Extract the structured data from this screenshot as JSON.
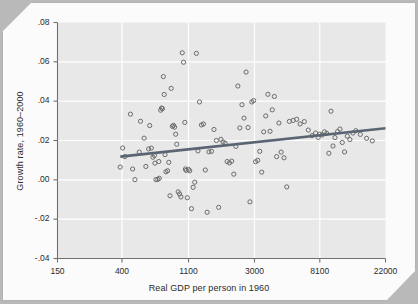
{
  "figure": {
    "background_color": "#e8e8e8",
    "grid_color": "#ffffff",
    "marker_color": "#6b6b6b",
    "line_color": "#5a6472",
    "axis_color": "#707070",
    "text_color": "#2b2b2b"
  },
  "chart_data": {
    "type": "scatter",
    "title": "",
    "xlabel": "Real GDP per person in 1960",
    "ylabel": "Growth rate, 1960–2000",
    "x_scale": "log",
    "y_scale": "linear",
    "xlim": [
      150,
      22000
    ],
    "ylim": [
      -0.04,
      0.08
    ],
    "xticks": [
      150,
      400,
      1100,
      3000,
      8100,
      22000
    ],
    "xticklabels": [
      "150",
      "400",
      "1100",
      "3000",
      "8100",
      "22000"
    ],
    "yticks": [
      -0.04,
      -0.02,
      0.0,
      0.02,
      0.04,
      0.06,
      0.08
    ],
    "yticklabels": [
      "-.04",
      "-.02",
      ".00",
      ".02",
      ".04",
      ".06",
      ".08"
    ],
    "grid": true,
    "grid_axis": "both",
    "legend": false,
    "series": [
      {
        "name": "Countries",
        "marker": "open-circle",
        "x": [
          389,
          404,
          418,
          455,
          470,
          487,
          520,
          530,
          560,
          575,
          600,
          610,
          625,
          640,
          655,
          660,
          670,
          690,
          700,
          705,
          720,
          730,
          740,
          750,
          760,
          770,
          780,
          800,
          815,
          830,
          845,
          860,
          875,
          890,
          905,
          920,
          940,
          960,
          980,
          1000,
          1020,
          1040,
          1050,
          1060,
          1080,
          1100,
          1120,
          1150,
          1180,
          1210,
          1240,
          1270,
          1300,
          1340,
          1380,
          1420,
          1460,
          1500,
          1560,
          1620,
          1680,
          1740,
          1800,
          1860,
          1920,
          1980,
          2050,
          2120,
          2190,
          2260,
          2330,
          2400,
          2480,
          2560,
          2640,
          2720,
          2800,
          2880,
          2960,
          3050,
          3150,
          3250,
          3350,
          3450,
          3560,
          3680,
          3800,
          3930,
          4060,
          4200,
          4350,
          4500,
          4700,
          4900,
          5100,
          5400,
          5700,
          6000,
          6400,
          6800,
          7200,
          7600,
          7900,
          8100,
          8400,
          8700,
          9000,
          9300,
          9600,
          9900,
          10200,
          10600,
          11000,
          11400,
          11800,
          12300,
          12800,
          13400,
          14000,
          15000,
          16500,
          18000
        ],
        "y": [
          0.0065,
          0.0162,
          0.0118,
          0.0334,
          0.0055,
          0.0001,
          0.0141,
          0.0298,
          0.0212,
          0.0068,
          0.0157,
          0.0276,
          0.0161,
          0.0115,
          0.0124,
          0.0085,
          0.0001,
          0.0002,
          0.0093,
          0.0008,
          0.0354,
          0.0365,
          0.0362,
          0.0525,
          0.0434,
          0.0128,
          0.0041,
          0.0046,
          0.0089,
          -0.0081,
          0.0465,
          0.0272,
          0.0277,
          0.0268,
          0.0232,
          0.0181,
          -0.0061,
          -0.0072,
          -0.0087,
          0.0646,
          0.0598,
          0.0292,
          0.0055,
          0.0048,
          -0.0091,
          0.0053,
          0.0046,
          -0.0147,
          -0.0038,
          -0.0012,
          0.0643,
          0.0147,
          0.0396,
          0.0279,
          0.0284,
          0.005,
          -0.0165,
          0.0142,
          0.0145,
          0.0256,
          0.02,
          -0.014,
          0.0206,
          0.0192,
          0.0186,
          0.0093,
          0.0086,
          0.0095,
          0.0029,
          0.017,
          0.0477,
          0.0264,
          0.0382,
          0.0314,
          0.0548,
          0.0266,
          -0.0112,
          0.0396,
          0.0403,
          0.0092,
          0.0099,
          0.0145,
          0.0039,
          0.0244,
          0.0325,
          0.0435,
          0.0247,
          0.0356,
          0.0424,
          0.0118,
          0.0289,
          0.0141,
          0.0112,
          -0.0036,
          0.0297,
          0.0302,
          0.0308,
          0.0284,
          0.0296,
          0.0253,
          0.0225,
          0.0238,
          0.0216,
          0.0232,
          0.0228,
          0.0244,
          0.0236,
          0.0135,
          0.0349,
          0.0172,
          0.0215,
          0.0245,
          0.0258,
          0.019,
          0.0142,
          0.0222,
          0.0205,
          0.0238,
          0.025,
          0.0231,
          0.0211,
          0.0198
        ]
      }
    ],
    "fit_line": {
      "name": "regression line",
      "x": [
        390,
        22000
      ],
      "y": [
        0.0118,
        0.0262
      ]
    }
  }
}
